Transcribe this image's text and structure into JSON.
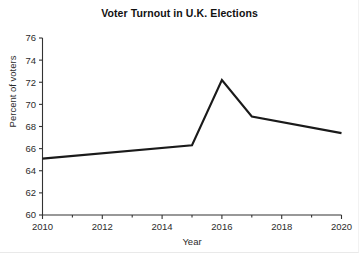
{
  "chart_data": {
    "type": "line",
    "title": "Voter Turnout in U.K. Elections",
    "xlabel": "Year",
    "ylabel": "Percent of voters",
    "x": [
      2010,
      2015,
      2016,
      2017,
      2020
    ],
    "values": [
      65.1,
      66.3,
      72.2,
      68.9,
      67.4
    ],
    "series": [
      {
        "name": "Voter turnout",
        "x": [
          2010,
          2015,
          2016,
          2017,
          2020
        ],
        "values": [
          65.1,
          66.3,
          72.2,
          68.9,
          67.4
        ]
      }
    ],
    "xlim": [
      2010,
      2020
    ],
    "ylim": [
      60,
      76
    ],
    "xticks": [
      2010,
      2012,
      2014,
      2016,
      2018,
      2020
    ],
    "xtick_labels": [
      "2010",
      "2012",
      "2014",
      "2016",
      "2018",
      "2020"
    ],
    "xminor_ticks": [
      2011,
      2013,
      2015,
      2017,
      2019
    ],
    "yticks": [
      60,
      62,
      64,
      66,
      68,
      70,
      72,
      74,
      76
    ],
    "ytick_labels": [
      "60",
      "62",
      "64",
      "66",
      "68",
      "70",
      "72",
      "74",
      "76"
    ],
    "grid": false,
    "legend": false,
    "legend_position": "none",
    "line_color": "#1a1a1a",
    "background_color": "#ffffff",
    "axis_color": "#333333"
  }
}
